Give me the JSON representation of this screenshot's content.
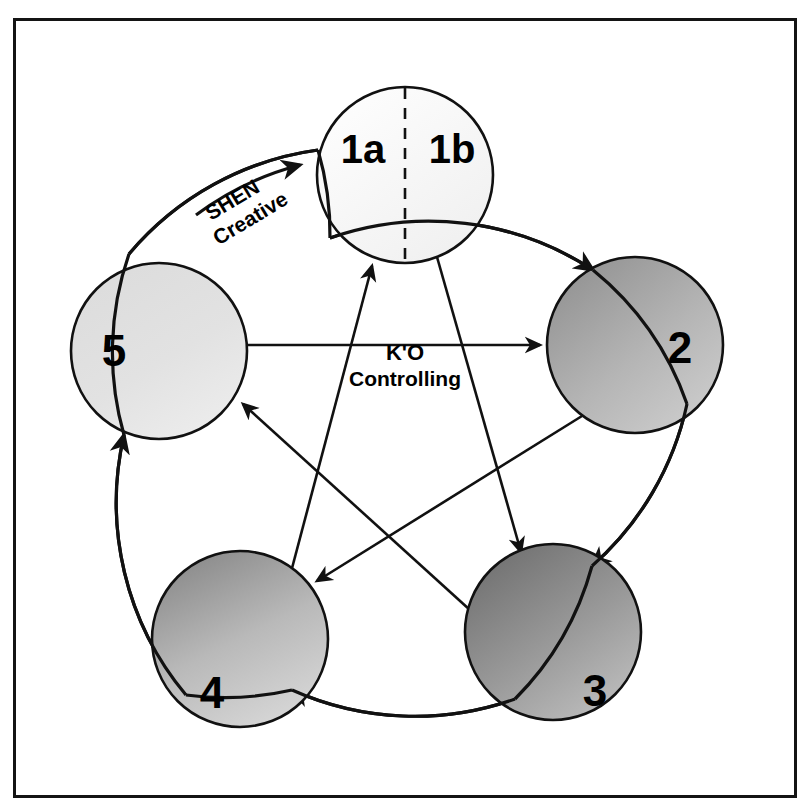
{
  "figure": {
    "title_visible": false,
    "background_color": "#ffffff",
    "frame_color": "#141414",
    "stroke_color": "#111111"
  },
  "nodes": [
    {
      "id": "1",
      "label_a": "1a",
      "label_b": "1b",
      "cx": 405,
      "cy": 175,
      "r": 88,
      "fill_light": "#ffffff",
      "fill_dark": "#f2f2f2",
      "divided": true,
      "divider": "dashed"
    },
    {
      "id": "2",
      "label": "2",
      "cx": 635,
      "cy": 345,
      "r": 88,
      "fill_light": "#c9c9c9",
      "fill_dark": "#8f8f8f",
      "divided": false
    },
    {
      "id": "3",
      "label": "3",
      "cx": 553,
      "cy": 632,
      "r": 88,
      "fill_light": "#b4b4b4",
      "fill_dark": "#6e6e6e",
      "divided": false
    },
    {
      "id": "4",
      "label": "4",
      "cx": 240,
      "cy": 639,
      "r": 88,
      "fill_light": "#cfcfcf",
      "fill_dark": "#8a8a8a",
      "divided": false
    },
    {
      "id": "5",
      "label": "5",
      "cx": 159,
      "cy": 351,
      "r": 88,
      "fill_light": "#e3e3e3",
      "fill_dark": "#c4c4c4",
      "divided": false
    }
  ],
  "cycles": {
    "shen": {
      "name": "SHEN",
      "subtitle": "Creative",
      "label_x": 228,
      "label_y": 196,
      "label_rotation": -31,
      "edges": [
        {
          "from": "1",
          "to": "2"
        },
        {
          "from": "2",
          "to": "3"
        },
        {
          "from": "3",
          "to": "4"
        },
        {
          "from": "4",
          "to": "5"
        },
        {
          "from": "5",
          "to": "1"
        }
      ]
    },
    "ko": {
      "name": "K'O",
      "subtitle": "Controlling",
      "label_x": 405,
      "label_y": 353,
      "edges": [
        {
          "from": "1",
          "to": "3"
        },
        {
          "from": "3",
          "to": "5"
        },
        {
          "from": "5",
          "to": "2"
        },
        {
          "from": "2",
          "to": "4"
        },
        {
          "from": "4",
          "to": "1"
        }
      ]
    }
  },
  "typography": {
    "node_number_size": 44,
    "node_pair_size": 40,
    "cycle_name_size": 22,
    "cycle_sub_size": 21
  }
}
